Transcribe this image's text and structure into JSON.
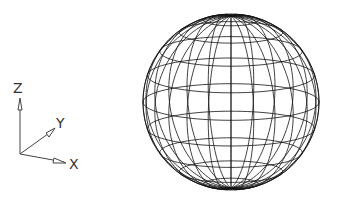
{
  "diagram": {
    "type": "wireframe-sphere",
    "axes": {
      "z_label": "Z",
      "y_label": "Y",
      "x_label": "X"
    },
    "sphere": {
      "center_x": 231,
      "center_y": 102,
      "radius": 88,
      "tilt_deg": 12,
      "meridians": 24,
      "parallels": 10,
      "stroke": "#111111"
    }
  }
}
